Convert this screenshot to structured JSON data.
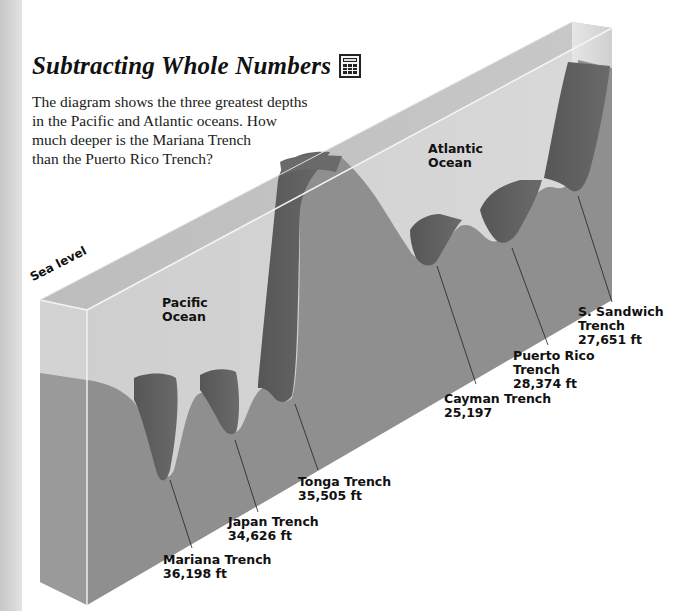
{
  "header": {
    "title": "Subtracting Whole Numbers",
    "title_icon": "calculator-icon"
  },
  "intro": {
    "lines": [
      "The diagram shows the three greatest depths",
      "in the Pacific and Atlantic oceans. How",
      "much deeper is the Mariana Trench",
      "than the Puerto Rico Trench?"
    ]
  },
  "diagram": {
    "sea_level_label": "Sea level",
    "oceans": [
      {
        "name_line1": "Pacific",
        "name_line2": "Ocean"
      },
      {
        "name_line1": "Atlantic",
        "name_line2": "Ocean"
      }
    ],
    "trenches": [
      {
        "line1": "Mariana Trench",
        "line2": "36,198 ft",
        "line3": "",
        "ocean": "Pacific",
        "depth_ft": 36198
      },
      {
        "line1": "Japan Trench",
        "line2": "34,626 ft",
        "line3": "",
        "ocean": "Pacific",
        "depth_ft": 34626
      },
      {
        "line1": "Tonga Trench",
        "line2": "35,505 ft",
        "line3": "",
        "ocean": "Pacific",
        "depth_ft": 35505
      },
      {
        "line1": "Cayman Trench",
        "line2": "25,197",
        "line3": "",
        "ocean": "Atlantic",
        "depth_ft": 25197
      },
      {
        "line1": "Puerto Rico",
        "line2": "Trench",
        "line3": "28,374 ft",
        "ocean": "Atlantic",
        "depth_ft": 28374
      },
      {
        "line1": "S. Sandwich",
        "line2": "Trench",
        "line3": "27,651 ft",
        "ocean": "Atlantic",
        "depth_ft": 27651
      }
    ],
    "colors": {
      "water_top": "#c4c4c4",
      "water_front": "#d2d2d2",
      "seafloor": "#8e8e8e",
      "trench_wall": "#5e5e5e",
      "edge_line": "#f2f2f2",
      "margin_strip": "#cfcfcf"
    }
  }
}
